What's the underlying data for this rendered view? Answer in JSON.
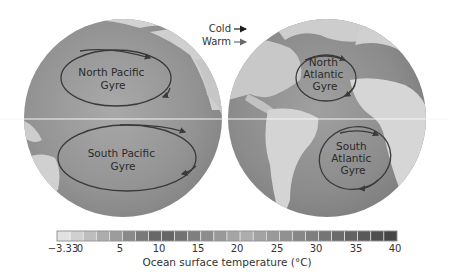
{
  "figure": {
    "legend": {
      "cold_label": "Cold",
      "warm_label": "Warm",
      "cold_arrow_color": "#1e1e1e",
      "warm_arrow_color": "#6a6a6a"
    },
    "globes": [
      {
        "name": "pacific-hemisphere",
        "gyres": [
          {
            "name": "north-pacific",
            "lines": [
              "North Pacific",
              "Gyre"
            ]
          },
          {
            "name": "south-pacific",
            "lines": [
              "South Pacific",
              "Gyre"
            ]
          }
        ]
      },
      {
        "name": "atlantic-hemisphere",
        "gyres": [
          {
            "name": "north-atlantic",
            "lines": [
              "North",
              "Atlantic",
              "Gyre"
            ]
          },
          {
            "name": "south-atlantic",
            "lines": [
              "South",
              "Atlantic",
              "Gyre"
            ]
          }
        ]
      }
    ],
    "colorbar": {
      "label": "Ocean surface temperature (°C)",
      "ticks": [
        "−3.33",
        "0",
        "5",
        "10",
        "15",
        "20",
        "25",
        "30",
        "35",
        "40"
      ],
      "min": -3.33,
      "max": 40
    }
  }
}
